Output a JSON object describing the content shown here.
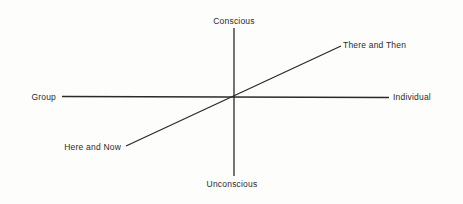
{
  "diagram": {
    "type": "three-axis conceptual diagram",
    "line_color": "#2a2a2a",
    "background_color": "#fdfdfb",
    "axes": [
      {
        "name": "vertical",
        "positive_label": "Conscious",
        "negative_label": "Unconscious"
      },
      {
        "name": "horizontal",
        "positive_label": "Individual",
        "negative_label": "Group"
      },
      {
        "name": "diagonal",
        "positive_label": "There and Then",
        "negative_label": "Here and Now"
      }
    ]
  },
  "labels": {
    "top": "Conscious",
    "bottom": "Unconscious",
    "left": "Group",
    "right": "Individual",
    "upper_right": "There and Then",
    "lower_left": "Here and Now"
  }
}
